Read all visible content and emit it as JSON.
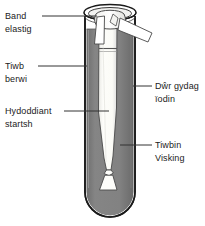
{
  "diagram": {
    "background_color": "#ffffff",
    "water_color": "#808080",
    "glass_outline_color": "#1a1a1a",
    "tubing_color": "#fbfbf8",
    "label_text_color": "#222222",
    "labels": {
      "band_elastig": {
        "line1": "Band",
        "line2": "elastig"
      },
      "tiwb_berwi": {
        "line1": "Tiwb",
        "line2": "berwi"
      },
      "hydoddiant_startsh": {
        "line1": "Hydoddiant",
        "line2": "startsh"
      },
      "dwr_gydag_iodin": {
        "line1": "Dŵr gydag",
        "line2": "ïodin"
      },
      "tiwbin_visking": {
        "line1": "Tiwbin",
        "line2": "Visking"
      }
    },
    "parts": {
      "boiling_tube": "tiwb-berwi",
      "elastic_band": "band-elastig",
      "visking_tubing": "tiwbin-visking",
      "starch_solution": "hydoddiant-startsh",
      "iodine_water": "dwr-gydag-iodin"
    }
  }
}
